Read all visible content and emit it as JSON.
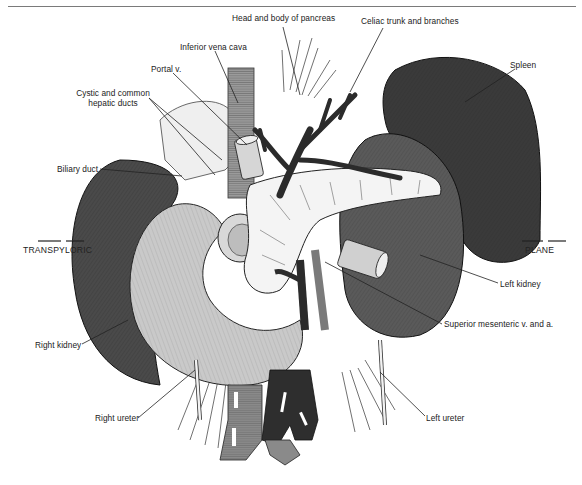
{
  "figure": {
    "type": "anatomical illustration",
    "labels": {
      "head_body_pancreas": "Head and body of pancreas",
      "celiac_trunk": "Celiac trunk and branches",
      "inferior_vena_cava": "Inferior vena cava",
      "portal_v": "Portal v.",
      "cystic_ducts_line1": "Cystic and common",
      "cystic_ducts_line2": "hepatic ducts",
      "spleen": "Spleen",
      "biliary_duct": "Biliary duct",
      "transpyloric": "TRANSPYLORIC",
      "plane": "PLANE",
      "left_kidney": "Left kidney",
      "superior_mesenteric": "Superior mesenteric v. and a.",
      "right_kidney": "Right kidney",
      "right_ureter": "Right ureter",
      "left_ureter": "Left ureter"
    },
    "colors": {
      "background": "#ffffff",
      "kidney_dark": "#4a4a4a",
      "spleen_dark": "#3a3a3a",
      "duodenum_light": "#c9c9c9",
      "pancreas_white": "#f2f2f2",
      "vein_dark": "#2b2b2b",
      "artery_gray": "#8a8a8a",
      "leader_line": "#222222"
    }
  }
}
